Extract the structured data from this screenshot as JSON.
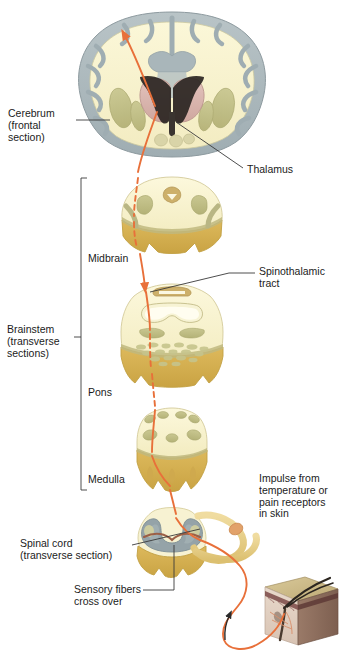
{
  "figure": {
    "type": "anatomical-diagram",
    "background_color": "#ffffff"
  },
  "labels": {
    "cerebrum": "Cerebrum\n(frontal\nsection)",
    "thalamus": "Thalamus",
    "midbrain": "Midbrain",
    "brainstem": "Brainstem\n(transverse\nsections)",
    "spinothalamic_tract": "Spinothalamic\ntract",
    "pons": "Pons",
    "medulla": "Medulla",
    "impulse": "Impulse from\ntemperature or\npain receptors\nin skin",
    "spinal_cord": "Spinal cord\n(transverse section)",
    "sensory_fibers": "Sensory fibers\ncross over"
  },
  "colors": {
    "tract_orange": "#e8703a",
    "gray_matter": "#95a3a8",
    "white_matter": "#f7f2cf",
    "brainstem_gold": "#d9b košt"
  },
  "structures": [
    {
      "name": "cerebrum-frontal-section",
      "region": "top"
    },
    {
      "name": "thalamus",
      "region": "center of cerebrum"
    },
    {
      "name": "midbrain-section",
      "region": "upper brainstem"
    },
    {
      "name": "pons-section",
      "region": "mid brainstem"
    },
    {
      "name": "medulla-section",
      "region": "lower brainstem"
    },
    {
      "name": "spinal-cord-section",
      "region": "bottom"
    },
    {
      "name": "skin-block",
      "region": "bottom right"
    }
  ]
}
